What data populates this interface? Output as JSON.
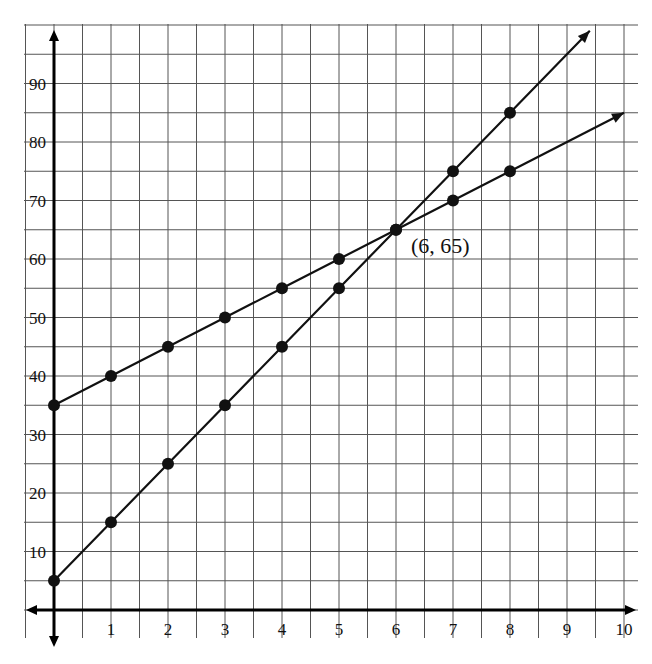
{
  "chart_data": {
    "type": "line",
    "title": "",
    "xlabel": "",
    "ylabel": "",
    "xlim": [
      -0.5,
      10.2
    ],
    "ylim": [
      -5,
      100
    ],
    "grid": true,
    "x_ticks": [
      1,
      2,
      3,
      4,
      5,
      6,
      7,
      8,
      9,
      10
    ],
    "x_tick_labels": [
      "1",
      "2",
      "3",
      "4",
      "5",
      "6",
      "7",
      "8",
      "9",
      "10"
    ],
    "y_ticks": [
      10,
      20,
      30,
      40,
      50,
      60,
      70,
      80,
      90
    ],
    "y_tick_labels": [
      "10",
      "20",
      "30",
      "40",
      "50",
      "60",
      "70",
      "80",
      "90"
    ],
    "series": [
      {
        "name": "Line A",
        "x": [
          0,
          1,
          2,
          3,
          4,
          5,
          6,
          7,
          8
        ],
        "values": [
          35,
          40,
          45,
          50,
          55,
          60,
          65,
          70,
          75
        ],
        "arrow_to": [
          10,
          85
        ]
      },
      {
        "name": "Line B",
        "x": [
          0,
          1,
          2,
          3,
          4,
          5,
          6,
          7,
          8
        ],
        "values": [
          5,
          15,
          25,
          35,
          45,
          55,
          65,
          75,
          85
        ],
        "arrow_to": [
          9.4,
          99
        ]
      }
    ],
    "annotations": [
      {
        "text": "(6, 65)",
        "x": 6,
        "y": 65
      }
    ],
    "colors": {
      "line": "#111111",
      "grid": "#555555",
      "axis": "#000000"
    }
  }
}
